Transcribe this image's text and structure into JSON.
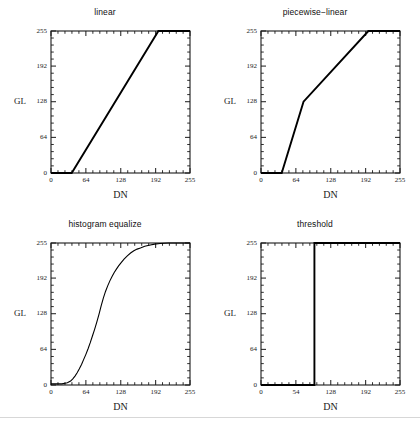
{
  "figure": {
    "background": "#ffffff",
    "line_color": "#000000",
    "axis_color": "#1a1a1a",
    "rows": 2,
    "cols": 2,
    "footer_rule": true
  },
  "axis_common": {
    "xlabel": "DN",
    "ylabel": "GL",
    "xlim": [
      0,
      255
    ],
    "ylim": [
      0,
      255
    ],
    "xticks": [
      0,
      64,
      128,
      192,
      255
    ],
    "yticks": [
      0,
      64,
      128,
      192,
      255
    ],
    "ytick_labels": [
      "0",
      "64",
      "128",
      "192",
      "255"
    ],
    "minor_ticks_per_interval": 4,
    "grid": false,
    "legend": "none"
  },
  "chart_data": [
    {
      "type": "line",
      "id": "linear",
      "title": "linear",
      "xlabel": "DN",
      "ylabel": "GL",
      "xlim": [
        0,
        255
      ],
      "ylim": [
        0,
        255
      ],
      "xticks": [
        0,
        64,
        128,
        192,
        255
      ],
      "yticks": [
        0,
        64,
        128,
        192,
        255
      ],
      "xtick_labels": [
        "0",
        "64",
        "128",
        "192",
        "255"
      ],
      "ytick_labels": [
        "0",
        "64",
        "128",
        "192",
        "255"
      ],
      "grid": false,
      "series": [
        {
          "name": "linear stretch",
          "x": [
            0,
            38,
            197,
            255
          ],
          "values": [
            0,
            0,
            255,
            255
          ]
        }
      ]
    },
    {
      "type": "line",
      "id": "piecewise-linear",
      "title": "piecewise−linear",
      "xlabel": "DN",
      "ylabel": "GL",
      "xlim": [
        0,
        255
      ],
      "ylim": [
        0,
        255
      ],
      "xticks": [
        0,
        64,
        128,
        192,
        255
      ],
      "yticks": [
        0,
        64,
        128,
        192,
        255
      ],
      "xtick_labels": [
        "0",
        "64",
        "128",
        "192",
        "255"
      ],
      "ytick_labels": [
        "0",
        "64",
        "128",
        "192",
        "255"
      ],
      "grid": false,
      "series": [
        {
          "name": "piecewise stretch",
          "x": [
            0,
            38,
            78,
            197,
            255
          ],
          "values": [
            0,
            0,
            128,
            255,
            255
          ]
        }
      ]
    },
    {
      "type": "line",
      "id": "histogram-equalize",
      "title": "histogram equalize",
      "xlabel": "DN",
      "ylabel": "GL",
      "xlim": [
        0,
        255
      ],
      "ylim": [
        0,
        255
      ],
      "xticks": [
        0,
        64,
        128,
        192,
        255
      ],
      "yticks": [
        0,
        64,
        128,
        192,
        255
      ],
      "xtick_labels": [
        "0",
        "64",
        "128",
        "192",
        "255"
      ],
      "ytick_labels": [
        "0",
        "64",
        "128",
        "192",
        "255"
      ],
      "grid": false,
      "series": [
        {
          "name": "cumulative distribution",
          "x": [
            0,
            20,
            30,
            36,
            40,
            44,
            48,
            52,
            56,
            60,
            64,
            68,
            72,
            76,
            80,
            84,
            88,
            92,
            96,
            100,
            104,
            108,
            112,
            116,
            120,
            124,
            128,
            134,
            140,
            146,
            152,
            158,
            164,
            172,
            180,
            190,
            200,
            215,
            230,
            255
          ],
          "values": [
            2,
            2,
            4,
            7,
            11,
            16,
            22,
            29,
            37,
            46,
            55,
            65,
            76,
            88,
            100,
            113,
            127,
            142,
            156,
            168,
            178,
            187,
            195,
            202,
            208,
            214,
            219,
            226,
            232,
            237,
            241,
            244,
            246,
            249,
            251,
            253,
            254,
            255,
            255,
            255
          ]
        }
      ]
    },
    {
      "type": "line",
      "id": "threshold",
      "title": "threshold",
      "xlabel": "DN",
      "ylabel": "GL",
      "xlim": [
        0,
        255
      ],
      "ylim": [
        0,
        255
      ],
      "xticks": [
        0,
        64,
        128,
        192,
        255
      ],
      "yticks": [
        0,
        64,
        128,
        192,
        255
      ],
      "xtick_labels": [
        "0",
        "54",
        "128",
        "192",
        "255"
      ],
      "ytick_labels": [
        "0",
        "64",
        "128",
        "192",
        "255"
      ],
      "grid": false,
      "series": [
        {
          "name": "step threshold",
          "x": [
            0,
            98,
            98,
            255
          ],
          "values": [
            0,
            0,
            255,
            255
          ]
        }
      ]
    }
  ]
}
